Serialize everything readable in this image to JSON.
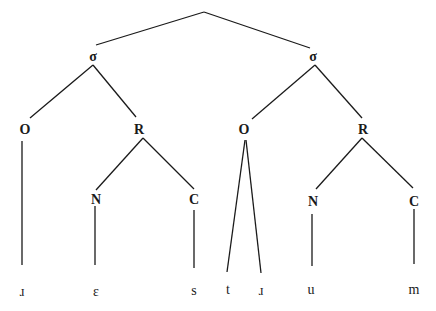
{
  "tree": {
    "nodes": {
      "sigma1": "σ",
      "sigma2": "σ",
      "onset1": "O",
      "rhyme1": "R",
      "nucleus1": "N",
      "coda1": "C",
      "onset2": "O",
      "rhyme2": "R",
      "nucleus2": "N",
      "coda2": "C"
    },
    "leaves": [
      "ɹ",
      "ɛ",
      "s",
      "t",
      "ɹ",
      "u",
      "m"
    ]
  }
}
